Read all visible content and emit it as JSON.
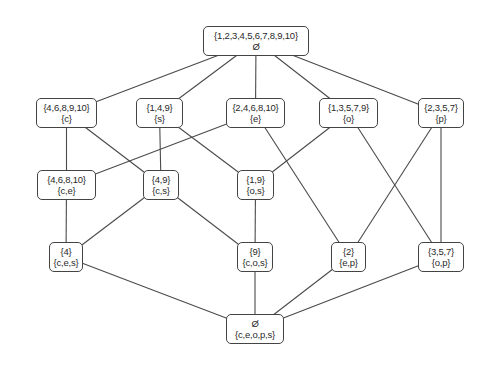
{
  "diagram": {
    "type": "concept-lattice",
    "nodes": [
      {
        "id": "top",
        "extent": "{1,2,3,4,5,6,7,8,9,10}",
        "intent": "Ø",
        "x": 203,
        "y": 26,
        "w": 106,
        "h": 30
      },
      {
        "id": "c",
        "extent": "{4,6,8,9,10}",
        "intent": "{c}",
        "x": 36,
        "y": 98,
        "w": 61,
        "h": 30
      },
      {
        "id": "s",
        "extent": "{1,4,9}",
        "intent": "{s}",
        "x": 136,
        "y": 98,
        "w": 47,
        "h": 30
      },
      {
        "id": "e",
        "extent": "{2,4,6,8,10}",
        "intent": "{e}",
        "x": 226,
        "y": 98,
        "w": 59,
        "h": 30
      },
      {
        "id": "o",
        "extent": "{1,3,5,7,9}",
        "intent": "{o}",
        "x": 319,
        "y": 98,
        "w": 59,
        "h": 30
      },
      {
        "id": "p",
        "extent": "{2,3,5,7}",
        "intent": "{p}",
        "x": 418,
        "y": 98,
        "w": 46,
        "h": 30
      },
      {
        "id": "ce",
        "extent": "{4,6,8,10}",
        "intent": "{c,e}",
        "x": 37,
        "y": 170,
        "w": 59,
        "h": 30
      },
      {
        "id": "cs",
        "extent": "{4,9}",
        "intent": "{c,s}",
        "x": 143,
        "y": 170,
        "w": 36,
        "h": 30
      },
      {
        "id": "os",
        "extent": "{1,9}",
        "intent": "{o,s}",
        "x": 237,
        "y": 170,
        "w": 37,
        "h": 30
      },
      {
        "id": "ces",
        "extent": "{4}",
        "intent": "{c,e,s}",
        "x": 49,
        "y": 242,
        "w": 34,
        "h": 30
      },
      {
        "id": "cos",
        "extent": "{9}",
        "intent": "{c,o,s}",
        "x": 237,
        "y": 242,
        "w": 36,
        "h": 30
      },
      {
        "id": "ep",
        "extent": "{2}",
        "intent": "{e,p}",
        "x": 331,
        "y": 242,
        "w": 35,
        "h": 30
      },
      {
        "id": "op",
        "extent": "{3,5,7}",
        "intent": "{o,p}",
        "x": 418,
        "y": 242,
        "w": 46,
        "h": 30
      },
      {
        "id": "bot",
        "extent": "Ø",
        "intent": "{c,e,o,p,s}",
        "x": 226,
        "y": 314,
        "w": 58,
        "h": 30
      }
    ],
    "edges": [
      [
        "top",
        "c"
      ],
      [
        "top",
        "s"
      ],
      [
        "top",
        "e"
      ],
      [
        "top",
        "o"
      ],
      [
        "top",
        "p"
      ],
      [
        "c",
        "ce"
      ],
      [
        "c",
        "cs"
      ],
      [
        "s",
        "cs"
      ],
      [
        "s",
        "os"
      ],
      [
        "e",
        "ce"
      ],
      [
        "e",
        "ep"
      ],
      [
        "o",
        "os"
      ],
      [
        "o",
        "op"
      ],
      [
        "p",
        "ep"
      ],
      [
        "p",
        "op"
      ],
      [
        "ce",
        "ces"
      ],
      [
        "cs",
        "ces"
      ],
      [
        "cs",
        "cos"
      ],
      [
        "os",
        "cos"
      ],
      [
        "ces",
        "bot"
      ],
      [
        "cos",
        "bot"
      ],
      [
        "ep",
        "bot"
      ],
      [
        "op",
        "bot"
      ]
    ]
  }
}
